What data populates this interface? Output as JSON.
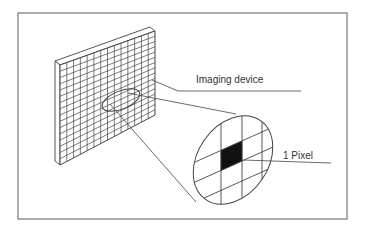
{
  "diagram": {
    "colors": {
      "stroke": "#444444",
      "frame": "#777777",
      "pixel_fill": "#111111",
      "background": "#ffffff",
      "text": "#333333"
    },
    "frame": {
      "x": 18,
      "y": 13,
      "w": 329,
      "h": 206
    },
    "labels": [
      {
        "id": "imaging-device",
        "text": "Imaging device",
        "x": 196,
        "y": 75
      },
      {
        "id": "one-pixel",
        "text": "1 Pixel",
        "x": 283,
        "y": 151
      }
    ],
    "panel": {
      "front": {
        "tl": [
          60,
          65
        ],
        "tr": [
          155,
          31
        ],
        "br": [
          155,
          115
        ],
        "bl": [
          60,
          165
        ]
      },
      "thickness": [
        -5,
        -4
      ],
      "cols": 14,
      "rows": 16
    },
    "panel_oval": {
      "cx": 121,
      "cy": 100,
      "rx": 20,
      "ry": 9,
      "rot": -22
    },
    "magnifier": {
      "cx": 233,
      "cy": 160,
      "rx": 35,
      "ry": 48,
      "rot": 35
    },
    "leaders": {
      "imaging_device": {
        "from": [
          152,
          80
        ],
        "mid": [
          178,
          91
        ],
        "to": [
          301,
          91
        ]
      },
      "one_pixel": {
        "from": [
          243,
          160
        ],
        "to": [
          331,
          163
        ]
      }
    }
  }
}
